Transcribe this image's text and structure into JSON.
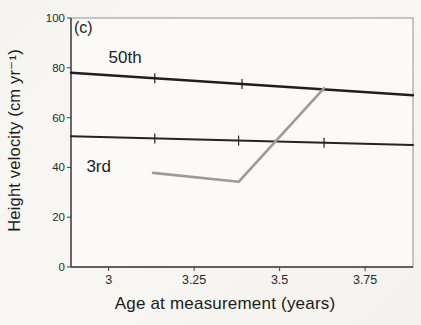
{
  "figure": {
    "panel_label": "(c)"
  },
  "colors": {
    "paper": "#f5f4f1",
    "plot_fill": "#fbfaf8",
    "frame": "#929292",
    "axis": "#3f3f3f",
    "text": "#1e1e1e",
    "tick_text": "#2a2a2a",
    "centile_line": "#1f1f1f",
    "child_line": "#9b9b9b"
  },
  "chart_data": {
    "type": "line",
    "title": "",
    "panel": "(c)",
    "xlabel": "Age at measurement (years)",
    "ylabel": "Height velocity (cm yr⁻¹)",
    "xlim": [
      2.89,
      3.89
    ],
    "ylim": [
      0,
      100
    ],
    "grid": false,
    "legend_position": "none (labels inline on chart)",
    "x_ticks": {
      "values": [
        3,
        3.25,
        3.5,
        3.75
      ],
      "labels": [
        "3",
        "3.25",
        "3.5",
        "3.75"
      ]
    },
    "y_ticks": {
      "values": [
        0,
        20,
        40,
        60,
        80,
        100
      ],
      "labels": [
        "0",
        "20",
        "40",
        "60",
        "80",
        "100"
      ]
    },
    "series": [
      {
        "id": "centile-50th",
        "name": "50th centile",
        "color": "#1f1f1f",
        "width": 2.4,
        "points": [
          [
            2.89,
            78
          ],
          [
            3.89,
            69
          ]
        ],
        "measurement_ticks": [
          3.135,
          3.39
        ]
      },
      {
        "id": "centile-3rd",
        "name": "3rd centile",
        "color": "#242424",
        "width": 2.0,
        "points": [
          [
            2.89,
            52.5
          ],
          [
            3.89,
            49
          ]
        ],
        "measurement_ticks": [
          3.135,
          3.38,
          3.63
        ]
      },
      {
        "id": "child-velocity",
        "name": "measured height velocity",
        "color": "#9b9b9b",
        "width": 2.6,
        "points": [
          [
            3.13,
            37.8
          ],
          [
            3.38,
            34.2
          ],
          [
            3.63,
            71.8
          ]
        ],
        "measurement_ticks": []
      }
    ],
    "annotations": [
      {
        "id": "label-50th",
        "text": "50th",
        "x": 3.0,
        "y": 82,
        "size": 17,
        "anchor": "start"
      },
      {
        "id": "label-3rd",
        "text": "3rd",
        "x": 2.935,
        "y": 38,
        "size": 17,
        "anchor": "start"
      }
    ]
  }
}
